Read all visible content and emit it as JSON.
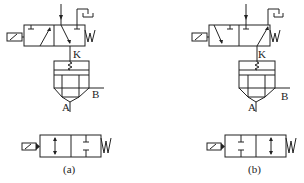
{
  "diagram": {
    "type": "pneumatic-circuit-schematic",
    "panels": [
      {
        "id": "a",
        "caption": "(a)",
        "top_valve": {
          "actuator": "solenoid",
          "return": "spring",
          "spring_label": "W",
          "pilot_label": "K"
        },
        "main_valve": {
          "port_a_label": "A",
          "port_b_label": "B"
        },
        "equivalent_valve": {
          "actuator": "solenoid",
          "return": "spring",
          "spring_label": "W",
          "positions": [
            "open-flow",
            "blocked"
          ]
        }
      },
      {
        "id": "b",
        "caption": "(b)",
        "top_valve": {
          "actuator": "solenoid",
          "return": "spring",
          "spring_label": "W",
          "pilot_label": "K"
        },
        "main_valve": {
          "port_a_label": "A",
          "port_b_label": "B"
        },
        "equivalent_valve": {
          "actuator": "solenoid",
          "return": "spring",
          "spring_label": "W",
          "positions": [
            "blocked",
            "open-flow"
          ]
        }
      }
    ],
    "colors": {
      "line": "#222222",
      "background": "#ffffff"
    }
  }
}
